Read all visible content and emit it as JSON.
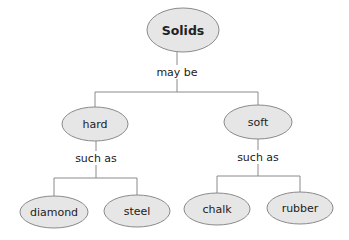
{
  "diagram": {
    "root": {
      "label": "Solids"
    },
    "link_root": "may be",
    "categories": [
      {
        "label": "hard",
        "link": "such as",
        "examples": [
          "diamond",
          "steel"
        ]
      },
      {
        "label": "soft",
        "link": "such as",
        "examples": [
          "chalk",
          "rubber"
        ]
      }
    ],
    "colors": {
      "node_fill": "#e6e6e6",
      "node_stroke": "#8a8a8a",
      "line": "#8a8a8a",
      "text": "#222222"
    }
  }
}
